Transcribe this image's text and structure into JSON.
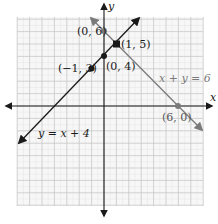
{
  "chart_data": {
    "type": "line",
    "title": "",
    "xlabel": "x",
    "ylabel": "y",
    "xlim": [
      -7,
      8
    ],
    "ylim": [
      -8,
      7
    ],
    "grid": true,
    "grid_minor_step": 0.5,
    "grid_major_step": 1,
    "series": [
      {
        "name": "y = x + 4",
        "equation": "y = x + 4",
        "color": "#1a1a1a",
        "points": [
          {
            "x": -1,
            "y": 3,
            "label": "(−1, 3)"
          },
          {
            "x": 0,
            "y": 4,
            "label": "(0, 4)"
          },
          {
            "x": 1,
            "y": 5,
            "label": "(1, 5)"
          }
        ]
      },
      {
        "name": "x + y = 6",
        "equation": "x + y = 6",
        "color": "#7a7a7a",
        "points": [
          {
            "x": 0,
            "y": 6,
            "label": "(0, 6)"
          },
          {
            "x": 1,
            "y": 5,
            "label": "(1, 5)"
          },
          {
            "x": 6,
            "y": 0,
            "label": "(6, 0)"
          }
        ]
      }
    ],
    "intersection": {
      "x": 1,
      "y": 5,
      "label": "(1, 5)"
    }
  },
  "labels": {
    "x_axis": "x",
    "y_axis": "y",
    "eq1": "y = x + 4",
    "eq2": "x + y = 6",
    "p_0_6": "(0, 6)",
    "p_1_5": "(1, 5)",
    "p_0_4": "(0, 4)",
    "p_m1_3": "(−1, 3)",
    "p_6_0": "(6, 0)"
  },
  "colors": {
    "grid_minor": "#e6e6e6",
    "grid_major": "#cfcfcf",
    "axis": "#1a1a1a",
    "line1": "#1a1a1a",
    "line2": "#7a7a7a"
  }
}
